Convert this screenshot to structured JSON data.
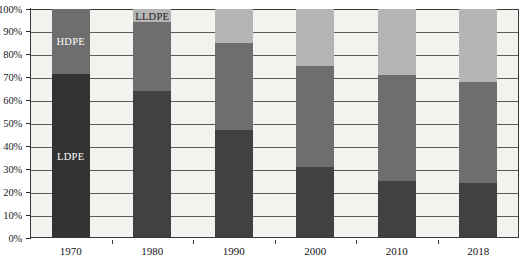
{
  "chart_data": {
    "type": "bar",
    "stacked": true,
    "normalized": true,
    "title": "",
    "subtitle": "",
    "xlabel": "",
    "ylabel": "",
    "categories": [
      "1970",
      "1980",
      "1990",
      "2000",
      "2010",
      "2018"
    ],
    "series": [
      {
        "name": "LDPE",
        "color": "#414141",
        "values": [
          71.5,
          64,
          47,
          31,
          24.5,
          24
        ]
      },
      {
        "name": "HDPE",
        "color": "#6e6e6e",
        "values": [
          28.5,
          30,
          38,
          44,
          46.5,
          44
        ]
      },
      {
        "name": "LLDPE",
        "color": "#b5b5b5",
        "values": [
          0,
          6,
          15,
          25,
          29,
          32
        ]
      }
    ],
    "ylim": [
      0,
      100
    ],
    "ytick_values": [
      0,
      10,
      20,
      30,
      40,
      50,
      60,
      70,
      80,
      90,
      100
    ],
    "ytick_labels": [
      "0%",
      "10%",
      "20%",
      "30%",
      "40%",
      "50%",
      "60%",
      "70%",
      "80%",
      "90%",
      "100%"
    ],
    "grid": true,
    "grid_axis": "y",
    "legend": "none",
    "annotations": [
      {
        "text": "LDPE",
        "category": "1970",
        "series": "LDPE",
        "text_color": "#ffffff"
      },
      {
        "text": "HDPE",
        "category": "1970",
        "series": "HDPE",
        "text_color": "#ffffff"
      },
      {
        "text": "LLDPE",
        "category": "1980",
        "series": "LLDPE",
        "text_color": "#1b1b1b"
      }
    ],
    "plot_background": "#f2f2ef",
    "axis_color": "#3a3a3a",
    "gridline_color": "#5b5b5b"
  }
}
